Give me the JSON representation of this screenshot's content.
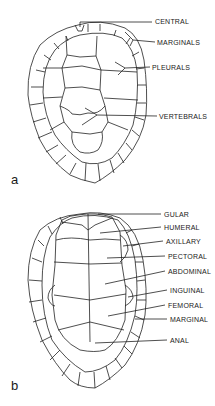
{
  "figure_a": {
    "panel_label": "a",
    "labels": [
      {
        "text": "CENTRAL",
        "x": 155,
        "y": 18
      },
      {
        "text": "MARGINALS",
        "x": 157,
        "y": 39
      },
      {
        "text": "PLEURALS",
        "x": 152,
        "y": 64
      },
      {
        "text": "VERTEBRALS",
        "x": 159,
        "y": 113
      }
    ]
  },
  "figure_b": {
    "panel_label": "b",
    "labels": [
      {
        "text": "GULAR",
        "x": 164,
        "y": 211
      },
      {
        "text": "HUMERAL",
        "x": 164,
        "y": 224
      },
      {
        "text": "AXILLARY",
        "x": 166,
        "y": 238
      },
      {
        "text": "PECTORAL",
        "x": 168,
        "y": 253
      },
      {
        "text": "ABDOMINAL",
        "x": 168,
        "y": 268
      },
      {
        "text": "INGUINAL",
        "x": 170,
        "y": 287
      },
      {
        "text": "FEMORAL",
        "x": 168,
        "y": 302
      },
      {
        "text": "MARGINAL",
        "x": 170,
        "y": 316
      },
      {
        "text": "ANAL",
        "x": 170,
        "y": 337
      }
    ]
  }
}
